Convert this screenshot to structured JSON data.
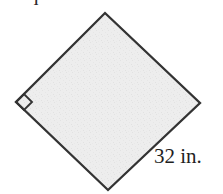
{
  "figure": {
    "caption": "Square",
    "shape_name": "square",
    "side_label": "32 in.",
    "side_length_value": 32,
    "side_length_unit": "in.",
    "right_angle_marker": "right-angle-marker",
    "colors": {
      "background": "#ffffff",
      "fill": "#ededed",
      "stroke": "#333333",
      "text": "#1f1f1f"
    },
    "vertices": {
      "top": [
        105,
        13
      ],
      "right": [
        200,
        103
      ],
      "bottom": [
        108,
        190
      ],
      "left": [
        16,
        102
      ]
    }
  }
}
